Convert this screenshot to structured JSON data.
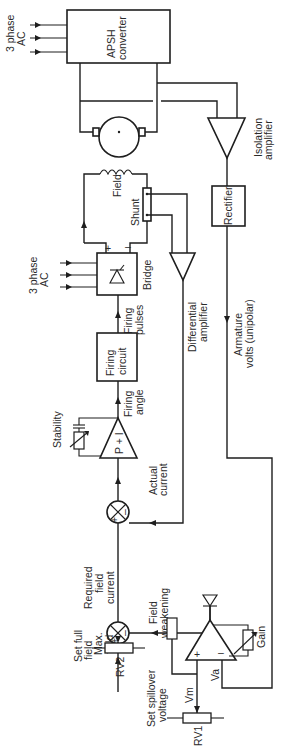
{
  "diagram": {
    "orientation": "rotated 90deg (read with page turned clockwise)",
    "blocks": {
      "apsh": {
        "line1": "APSH",
        "line2": "converter"
      },
      "isolation_amp": {
        "line1": "Isolation",
        "line2": "amplifier"
      },
      "rectifier": {
        "label": "Rectifier"
      },
      "bridge": {
        "label": "Bridge"
      },
      "differential_amp": {
        "line1": "Differential",
        "line2": "amplifier"
      },
      "firing_circuit": {
        "line1": "Firing",
        "line2": "circuit"
      },
      "pi_controller": {
        "label": "P + I"
      },
      "gain_amp": {
        "gain_label": "Gain",
        "plus": "+",
        "minus": "–"
      }
    },
    "labels": {
      "three_phase_top": {
        "line1": "3 phase",
        "line2": "AC"
      },
      "three_phase_bridge": {
        "line1": "3 phase",
        "line2": "AC"
      },
      "field": "Field",
      "shunt": "Shunt",
      "bridge_plus": "+",
      "bridge_minus": "–",
      "firing_pulses": {
        "line1": "Firing",
        "line2": "pulses"
      },
      "firing_angle": {
        "line1": "Firing",
        "line2": "angle"
      },
      "stability": "Stability",
      "armature_volts": {
        "line1": "Armature",
        "line2": "volts (unipolar)"
      },
      "actual_current": {
        "line1": "Actual",
        "line2": "current"
      },
      "required_field_current": {
        "line1": "Required",
        "line2": "field",
        "line3": "current"
      },
      "field_weakening": {
        "line1": "Field",
        "line2": "weakening"
      },
      "max_field": {
        "line1": "Max.",
        "line2": "field"
      },
      "set_full_field": {
        "line1": "Set full",
        "line2": "field"
      },
      "rv2": "RV2",
      "set_spillover": {
        "line1": "Set spillover",
        "line2": "voltage"
      },
      "rv1": "RV1",
      "vm": "Vm",
      "va": "Va",
      "sum_plus": "+",
      "sum_minus": "–"
    }
  }
}
